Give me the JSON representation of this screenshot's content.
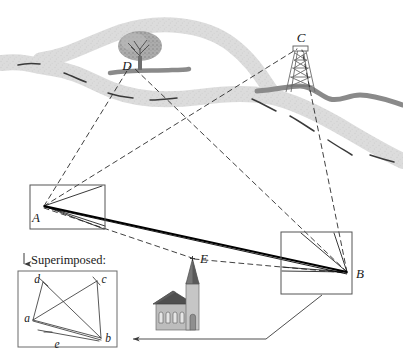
{
  "figure": {
    "type": "surveying-triangulation-diagram",
    "caption": {
      "superimposed_label": "Superimposed:",
      "arrow_icon": "down-arrow-icon"
    },
    "landmarks": [
      {
        "id": "C",
        "label": "C",
        "kind": "lattice-transmission-tower",
        "x": 300,
        "y": 38
      },
      {
        "id": "D",
        "label": "D",
        "kind": "tree",
        "x": 130,
        "y": 62
      },
      {
        "id": "E",
        "label": "E",
        "kind": "church",
        "x": 193,
        "y": 258
      }
    ],
    "stations": [
      {
        "id": "A",
        "label": "A",
        "x": 44,
        "y": 206,
        "box": {
          "x": 30,
          "y": 185,
          "w": 75,
          "h": 44
        }
      },
      {
        "id": "B",
        "label": "B",
        "x": 347,
        "y": 272,
        "box": {
          "x": 281,
          "y": 232,
          "w": 71,
          "h": 62
        }
      }
    ],
    "terrain": {
      "river_color": "#d9d9d9",
      "river_centerline_color": "#3c3c3c",
      "road_color": "#7a7a7a",
      "tree_canopy_color": "#9a9a9a",
      "church_roof_color": "#4a4a4a",
      "church_wall_color": "#b5b5b5"
    },
    "lines": {
      "sightline_color": "#2b2b2b",
      "baseline_color": "#000000",
      "box_border_color": "#555555"
    },
    "superimposed": {
      "box": {
        "x": 18,
        "y": 271,
        "w": 99,
        "h": 76
      },
      "vertices": [
        {
          "id": "a",
          "label": "a",
          "x": 33,
          "y": 320
        },
        {
          "id": "b",
          "label": "b",
          "x": 101,
          "y": 339
        },
        {
          "id": "c",
          "label": "c",
          "x": 98,
          "y": 283
        },
        {
          "id": "d",
          "label": "d",
          "x": 42,
          "y": 283
        }
      ],
      "edge_label": {
        "id": "e",
        "label": "e",
        "x": 57,
        "y": 348
      }
    }
  }
}
